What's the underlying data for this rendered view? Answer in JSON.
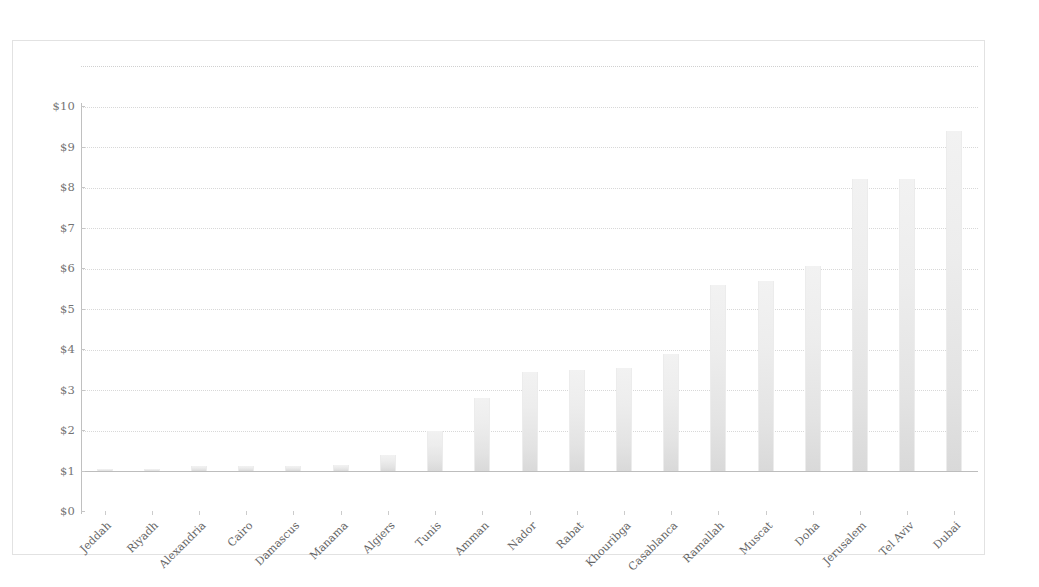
{
  "chart_data": {
    "type": "bar",
    "title": "",
    "subtitle": "",
    "xlabel": "",
    "ylabel": "",
    "ylim": [
      0,
      10
    ],
    "ytick_labels": [
      "$10",
      "$9",
      "$8",
      "$7",
      "$6",
      "$5",
      "$4",
      "$3",
      "$2",
      "$1",
      "$0"
    ],
    "ytick_values": [
      10,
      9,
      8,
      7,
      6,
      5,
      4,
      3,
      2,
      1,
      0
    ],
    "grid": true,
    "legend": false,
    "currency_prefix": "$",
    "categories": [
      "Jeddah",
      "Riyadh",
      "Alexandria",
      "Cairo",
      "Damascus",
      "Manama",
      "Algiers",
      "Tunis",
      "Amman",
      "Nador",
      "Rabat",
      "Khouribga",
      "Casablanca",
      "Ramallah",
      "Muscat",
      "Doha",
      "Jerusalem",
      "Tel Aviv",
      "Dubai"
    ],
    "values": [
      0.05,
      0.05,
      0.12,
      0.12,
      0.12,
      0.15,
      0.4,
      1.0,
      1.8,
      2.45,
      2.5,
      2.55,
      2.9,
      4.6,
      4.7,
      5.05,
      7.2,
      7.2,
      8.4
    ]
  },
  "style": {
    "bar_fill_top": "#f2f2f2",
    "bar_fill_bottom": "#d9d9d9",
    "gridline_color": "#d8d8d8",
    "axis_color": "#c0c0c0",
    "label_color": "#4a4a4a",
    "frame_color": "#e2e2e2",
    "background": "#ffffff"
  }
}
